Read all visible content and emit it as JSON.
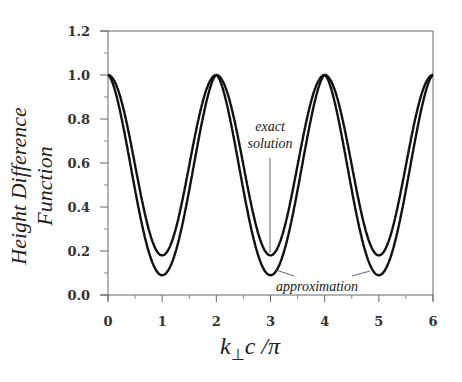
{
  "chart_data": {
    "type": "line",
    "title": "",
    "xlabel": "k⊥c /π",
    "ylabel": "Height Difference Function",
    "xlim": [
      0,
      6
    ],
    "ylim": [
      0,
      1.2
    ],
    "xticks": [
      "0",
      "1",
      "2",
      "3",
      "4",
      "5",
      "6"
    ],
    "yticks": [
      "0.0",
      "0.2",
      "0.4",
      "0.6",
      "0.8",
      "1.0",
      "1.2"
    ],
    "grid": false,
    "legend": "none (inline annotations)",
    "series": [
      {
        "name": "exact solution",
        "x": [
          0,
          0.5,
          1,
          1.5,
          2,
          2.5,
          3,
          3.5,
          4,
          4.5,
          5,
          5.5,
          6
        ],
        "values": [
          1.0,
          0.59,
          0.18,
          0.59,
          1.0,
          0.59,
          0.18,
          0.59,
          1.0,
          0.59,
          0.18,
          0.59,
          1.0
        ]
      },
      {
        "name": "approximation",
        "x": [
          0,
          0.5,
          1,
          1.5,
          2,
          2.5,
          3,
          3.5,
          4,
          4.5,
          5,
          5.5,
          6
        ],
        "values": [
          1.0,
          0.55,
          0.09,
          0.55,
          1.0,
          0.55,
          0.09,
          0.55,
          1.0,
          0.55,
          0.09,
          0.55,
          1.0
        ]
      }
    ],
    "annotations": [
      {
        "text": "exact solution",
        "points_to": {
          "x": 3,
          "y": 0.18
        }
      },
      {
        "text": "approximation",
        "points_to": [
          {
            "x": 3,
            "y": 0.09
          },
          {
            "x": 5,
            "y": 0.09
          }
        ]
      }
    ]
  },
  "labels": {
    "ylabel": "Height Difference Function",
    "xlabel_k": "k",
    "xlabel_sub": "⊥",
    "xlabel_rest": "c /π",
    "ann_exact_1": "exact",
    "ann_exact_2": "solution",
    "ann_approx": "approximation"
  }
}
